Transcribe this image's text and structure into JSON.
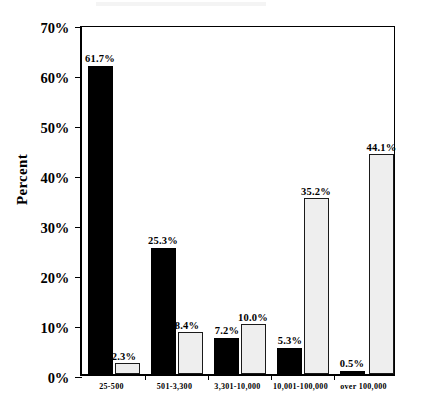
{
  "chart_data": {
    "type": "bar",
    "title": "",
    "subtitle": "",
    "xlabel": "",
    "ylabel": "Percent",
    "ylim": [
      0,
      70
    ],
    "ytick_values": [
      0,
      10,
      20,
      30,
      40,
      50,
      60,
      70
    ],
    "ytick_labels": [
      "0%",
      "10%",
      "20%",
      "30%",
      "40%",
      "50%",
      "60%",
      "70%"
    ],
    "grid": false,
    "legend": null,
    "legend_position": "none",
    "categories": [
      "25-500",
      "501-3,300",
      "3,301-10,000",
      "10,001-100,000",
      "over  100,000"
    ],
    "series": [
      {
        "name": "dark",
        "color": "#000000",
        "values": [
          61.7,
          25.3,
          7.2,
          5.3,
          0.5
        ],
        "labels": [
          "61.7%",
          "25.3%",
          "7.2%",
          "5.3%",
          "0.5%"
        ]
      },
      {
        "name": "light",
        "color": "#eeeeee",
        "values": [
          2.3,
          8.4,
          10.0,
          35.2,
          44.1
        ],
        "labels": [
          "2.3%",
          "8.4%",
          "10.0%",
          "35.2%",
          "44.1%"
        ]
      }
    ]
  }
}
